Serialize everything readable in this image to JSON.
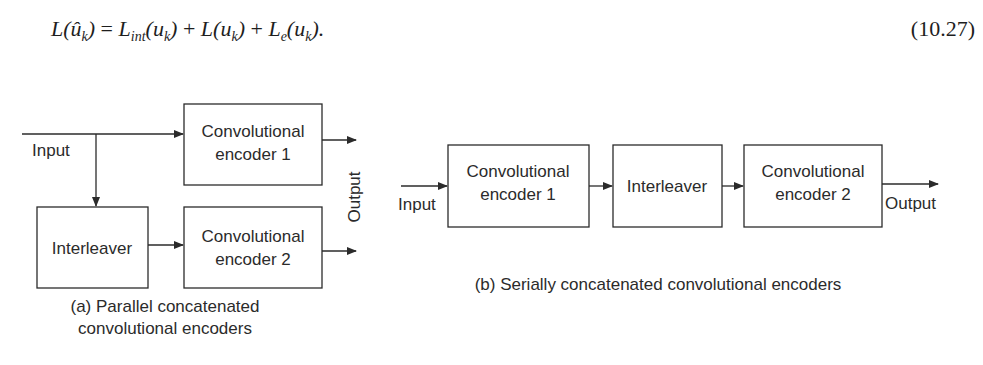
{
  "equation": {
    "lhs": "L(û_k)",
    "rhs_terms": [
      "L_int(u_k)",
      "L(u_k)",
      "L_e(u_k)"
    ],
    "number": "(10.27)"
  },
  "figure_a": {
    "input_label": "Input",
    "output_label": "Output",
    "blocks": {
      "encoder1": [
        "Convolutional",
        "encoder 1"
      ],
      "interleaver": "Interleaver",
      "encoder2": [
        "Convolutional",
        "encoder 2"
      ]
    },
    "caption": [
      "(a) Parallel concatenated",
      "convolutional encoders"
    ]
  },
  "figure_b": {
    "input_label": "Input",
    "output_label": "Output",
    "blocks": {
      "encoder1": [
        "Convolutional",
        "encoder 1"
      ],
      "interleaver": "Interleaver",
      "encoder2": [
        "Convolutional",
        "encoder 2"
      ]
    },
    "caption": "(b) Serially concatenated convolutional encoders"
  },
  "colors": {
    "ink": "#2b2b2b",
    "background": "#ffffff"
  }
}
